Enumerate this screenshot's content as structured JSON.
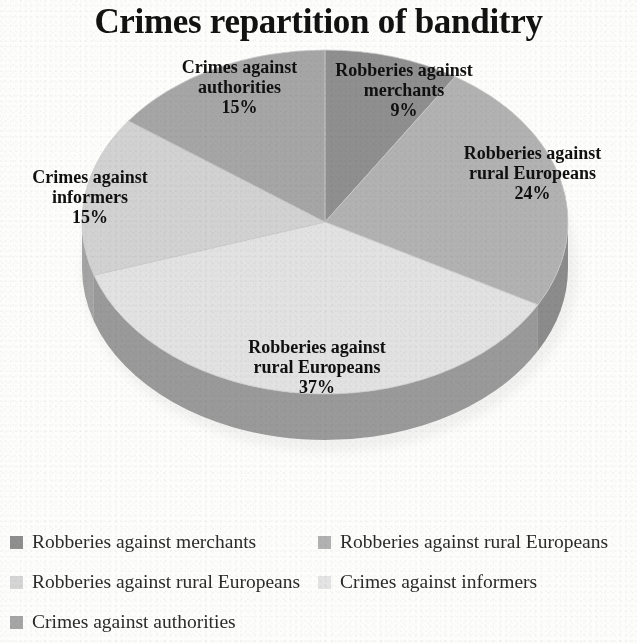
{
  "title": "Crimes repartition of banditry",
  "chart_data": {
    "type": "pie",
    "title": "Crimes repartition of banditry",
    "style": "3d-pie",
    "grid": false,
    "legend_position": "bottom",
    "legend_columns": 2,
    "unit": "%",
    "categories": [
      "Robberies against merchants",
      "Robberies against rural Europeans",
      "Robberies against rural Europeans",
      "Crimes against informers",
      "Crimes against authorities"
    ],
    "values": [
      9,
      24,
      37,
      15,
      15
    ],
    "colors": [
      "#8f8f8f",
      "#b2b2b2",
      "#e2e2e2",
      "#d2d2d2",
      "#a6a6a6"
    ],
    "slices": [
      {
        "label": "Robberies against merchants",
        "value": 9,
        "percent_text": "9%",
        "color": "#8f8f8f",
        "side_color": "#6f6f6f",
        "start_angle": 0,
        "end_angle": 32.4
      },
      {
        "label": "Robberies against rural Europeans",
        "value": 24,
        "percent_text": "24%",
        "color": "#b2b2b2",
        "side_color": "#8c8c8c",
        "start_angle": 32.4,
        "end_angle": 118.8
      },
      {
        "label": "Robberies against rural Europeans",
        "value": 37,
        "percent_text": "37%",
        "color": "#e2e2e2",
        "side_color": "#9a9a9a",
        "start_angle": 118.8,
        "end_angle": 252.0
      },
      {
        "label": "Crimes against informers",
        "value": 15,
        "percent_text": "15%",
        "color": "#d2d2d2",
        "side_color": "#a4a4a4",
        "start_angle": 252.0,
        "end_angle": 306.0
      },
      {
        "label": "Crimes against authorities",
        "value": 15,
        "percent_text": "15%",
        "color": "#a6a6a6",
        "side_color": "#858585",
        "start_angle": 306.0,
        "end_angle": 360.0
      }
    ],
    "data_labels": [
      {
        "name": "Crimes against authorities",
        "line1": "Crimes against",
        "line2": "authorities",
        "percent": "15%"
      },
      {
        "name": "Robberies against merchants",
        "line1": "Robberies against",
        "line2": "merchants",
        "percent": "9%"
      },
      {
        "name": "Robberies against rural Europeans 24",
        "line1": "Robberies against",
        "line2": "rural Europeans",
        "percent": "24%"
      },
      {
        "name": "Crimes against informers",
        "line1": "Crimes against",
        "line2": "informers",
        "percent": "15%"
      },
      {
        "name": "Robberies against rural Europeans 37",
        "line1": "Robberies against",
        "line2": "rural Europeans",
        "percent": "37%"
      }
    ]
  },
  "legend": {
    "items": [
      {
        "label": "Robberies against merchants",
        "color": "#8f8f8f"
      },
      {
        "label": "Robberies against rural Europeans",
        "color": "#b2b2b2"
      },
      {
        "label": "Robberies against rural Europeans",
        "color": "#d6d6d6"
      },
      {
        "label": "Crimes against informers",
        "color": "#e4e4e4"
      },
      {
        "label": "Crimes against authorities",
        "color": "#a6a6a6"
      }
    ]
  }
}
